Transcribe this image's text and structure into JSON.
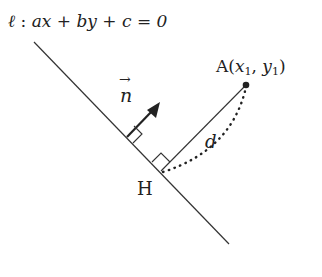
{
  "diagram": {
    "line_equation": {
      "name_symbol": "ℓ",
      "separator": " : ",
      "expression": "ax + by + c = 0"
    },
    "point_A": {
      "label": "A",
      "open": "(",
      "x": "x",
      "x_sub": "1",
      "comma": ", ",
      "y": "y",
      "y_sub": "1",
      "close": ")"
    },
    "foot_point": {
      "label": "H"
    },
    "distance": {
      "label": "d"
    },
    "normal_vector": {
      "label": "n",
      "arrow": "→"
    },
    "colors": {
      "line": "#333333",
      "text": "#222222",
      "background": "#ffffff"
    }
  }
}
